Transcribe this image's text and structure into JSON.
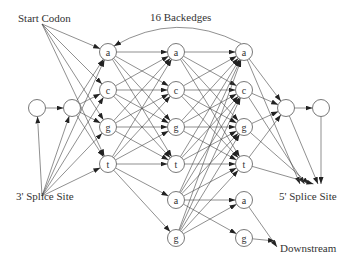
{
  "labels": {
    "start_codon": "Start Codon",
    "backedges": "16 Backedges",
    "splice3": "3' Splice Site",
    "splice5": "5' Splice Site",
    "downstream": "Downstream"
  },
  "nodes": [
    {
      "id": "L1",
      "x": 37,
      "y": 108,
      "label": ""
    },
    {
      "id": "L2",
      "x": 72,
      "y": 108,
      "label": ""
    },
    {
      "id": "A1",
      "x": 108,
      "y": 52,
      "label": "a"
    },
    {
      "id": "C1",
      "x": 108,
      "y": 90,
      "label": "c"
    },
    {
      "id": "G1",
      "x": 108,
      "y": 127,
      "label": "g"
    },
    {
      "id": "T1",
      "x": 108,
      "y": 164,
      "label": "t"
    },
    {
      "id": "A2",
      "x": 176,
      "y": 52,
      "label": "a"
    },
    {
      "id": "C2",
      "x": 176,
      "y": 90,
      "label": "c"
    },
    {
      "id": "G2",
      "x": 176,
      "y": 127,
      "label": "g"
    },
    {
      "id": "T2",
      "x": 176,
      "y": 164,
      "label": "t"
    },
    {
      "id": "A2b",
      "x": 176,
      "y": 200,
      "label": "a"
    },
    {
      "id": "G2b",
      "x": 176,
      "y": 238,
      "label": "g"
    },
    {
      "id": "A3",
      "x": 244,
      "y": 52,
      "label": "a"
    },
    {
      "id": "C3",
      "x": 244,
      "y": 90,
      "label": "c"
    },
    {
      "id": "G3",
      "x": 244,
      "y": 127,
      "label": "g"
    },
    {
      "id": "T3",
      "x": 244,
      "y": 164,
      "label": "t"
    },
    {
      "id": "A3b",
      "x": 244,
      "y": 200,
      "label": "a"
    },
    {
      "id": "G3b",
      "x": 244,
      "y": 238,
      "label": "g"
    },
    {
      "id": "R1",
      "x": 286,
      "y": 108,
      "label": ""
    },
    {
      "id": "R2",
      "x": 321,
      "y": 108,
      "label": ""
    }
  ],
  "edges": [
    [
      "L1",
      "L2"
    ],
    [
      "L2",
      "A1"
    ],
    [
      "L2",
      "C1"
    ],
    [
      "L2",
      "G1"
    ],
    [
      "L2",
      "T1"
    ],
    [
      "A1",
      "A2"
    ],
    [
      "A1",
      "C2"
    ],
    [
      "A1",
      "G2"
    ],
    [
      "A1",
      "T2"
    ],
    [
      "C1",
      "A2"
    ],
    [
      "C1",
      "C2"
    ],
    [
      "C1",
      "G2"
    ],
    [
      "C1",
      "T2"
    ],
    [
      "G1",
      "A2"
    ],
    [
      "G1",
      "C2"
    ],
    [
      "G1",
      "G2"
    ],
    [
      "G1",
      "T2"
    ],
    [
      "T1",
      "A2"
    ],
    [
      "T1",
      "C2"
    ],
    [
      "T1",
      "G2"
    ],
    [
      "T1",
      "T2"
    ],
    [
      "T1",
      "A2b"
    ],
    [
      "T1",
      "G2b"
    ],
    [
      "A2",
      "A3"
    ],
    [
      "A2",
      "C3"
    ],
    [
      "A2",
      "G3"
    ],
    [
      "A2",
      "T3"
    ],
    [
      "C2",
      "A3"
    ],
    [
      "C2",
      "C3"
    ],
    [
      "C2",
      "G3"
    ],
    [
      "C2",
      "T3"
    ],
    [
      "G2",
      "A3"
    ],
    [
      "G2",
      "C3"
    ],
    [
      "G2",
      "G3"
    ],
    [
      "G2",
      "T3"
    ],
    [
      "T2",
      "A3"
    ],
    [
      "T2",
      "C3"
    ],
    [
      "T2",
      "G3"
    ],
    [
      "T2",
      "T3"
    ],
    [
      "A2b",
      "A3"
    ],
    [
      "A2b",
      "C3"
    ],
    [
      "A2b",
      "G3"
    ],
    [
      "A2b",
      "T3"
    ],
    [
      "G2b",
      "A3"
    ],
    [
      "G2b",
      "C3"
    ],
    [
      "G2b",
      "G3"
    ],
    [
      "G2b",
      "T3"
    ],
    [
      "A2b",
      "A3b"
    ],
    [
      "A2b",
      "G3b"
    ],
    [
      "G2b",
      "A3b"
    ],
    [
      "A3",
      "R1"
    ],
    [
      "C3",
      "R1"
    ],
    [
      "G3",
      "R1"
    ],
    [
      "T3",
      "R1"
    ],
    [
      "R1",
      "R2"
    ]
  ],
  "start_codon_anchor": {
    "x": 42,
    "y": 24
  },
  "start_codon_targets": [
    "A1",
    "C1",
    "G1",
    "T1"
  ],
  "splice3_anchor": {
    "x": 42,
    "y": 196
  },
  "splice3_targets": [
    "L1",
    "L2",
    "A1",
    "C1",
    "G1",
    "T1"
  ],
  "splice5_target": {
    "x": 312,
    "y": 184
  },
  "splice5_sources": [
    "A3",
    "C3",
    "G3",
    "T3",
    "R1",
    "R2"
  ],
  "downstream_target": {
    "x": 277,
    "y": 247
  },
  "downstream_sources": [
    "A3b",
    "G3b"
  ],
  "backedge": {
    "from": "A3",
    "to": "A1"
  }
}
